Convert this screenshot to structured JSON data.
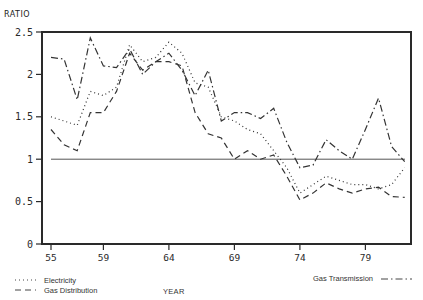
{
  "chart_data": {
    "type": "line",
    "title": "",
    "xlabel": "YEAR",
    "ylabel": "RATIO",
    "ylim": [
      0,
      2.5
    ],
    "xlim": [
      1955,
      1982
    ],
    "yticks": [
      0,
      0.5,
      1,
      1.5,
      2,
      2.5
    ],
    "ytick_labels": [
      "0",
      "0.5",
      "1",
      "1.5",
      "2",
      "2.5"
    ],
    "xticks": [
      55,
      59,
      64,
      69,
      74,
      79
    ],
    "xtick_labels": [
      "55",
      "59",
      "64",
      "69",
      "74",
      "79"
    ],
    "grid": false,
    "reference_line": {
      "y": 1,
      "style": "solid"
    },
    "legend_position": "bottom",
    "x": [
      55,
      56,
      57,
      58,
      59,
      60,
      61,
      62,
      63,
      64,
      65,
      66,
      67,
      68,
      69,
      70,
      71,
      72,
      73,
      74,
      75,
      76,
      77,
      78,
      79,
      80,
      81,
      82
    ],
    "series": [
      {
        "name": "Electricity",
        "style": "dotted",
        "values": [
          1.5,
          1.45,
          1.4,
          1.8,
          1.75,
          1.85,
          2.35,
          2.15,
          2.2,
          2.38,
          2.25,
          1.9,
          1.85,
          1.5,
          1.45,
          1.35,
          1.3,
          1.1,
          0.9,
          0.6,
          0.7,
          0.8,
          0.75,
          0.7,
          0.7,
          0.65,
          0.7,
          0.9
        ]
      },
      {
        "name": "Gas Distribution",
        "style": "dashed",
        "values": [
          1.35,
          1.17,
          1.1,
          1.55,
          1.55,
          1.8,
          2.25,
          2.05,
          2.15,
          2.15,
          2.1,
          1.55,
          1.3,
          1.25,
          1.0,
          1.1,
          1.0,
          1.05,
          0.8,
          0.52,
          0.6,
          0.72,
          0.65,
          0.6,
          0.65,
          0.67,
          0.56,
          0.55
        ]
      },
      {
        "name": "Gas Transmission",
        "style": "dashdot",
        "values": [
          2.2,
          2.18,
          1.7,
          2.43,
          2.1,
          2.08,
          2.3,
          2.0,
          2.15,
          2.25,
          2.05,
          1.75,
          2.05,
          1.45,
          1.55,
          1.55,
          1.48,
          1.6,
          1.2,
          0.9,
          0.93,
          1.23,
          1.1,
          1.0,
          1.35,
          1.72,
          1.15,
          0.97
        ]
      }
    ]
  },
  "labels": {
    "y_axis_title": "RATIO",
    "x_axis_title": "YEAR",
    "legend_electricity": "Electricity",
    "legend_gas_distribution": "Gas Distribution",
    "legend_gas_transmission": "Gas Transmission"
  }
}
